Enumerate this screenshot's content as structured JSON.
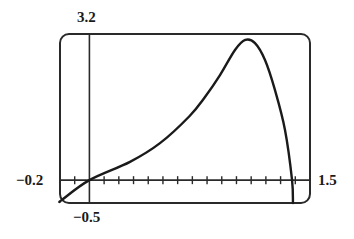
{
  "chart_data": {
    "type": "line",
    "title": "",
    "xlabel": "",
    "ylabel": "",
    "window": {
      "xmin": -0.2,
      "xmax": 1.5,
      "ymin": -0.5,
      "ymax": 3.2,
      "xscale": 0.1
    },
    "labels": {
      "xmin": "−0.2",
      "xmax": "1.5",
      "ymin": "−0.5",
      "ymax": "3.2"
    },
    "grid": false,
    "series": [
      {
        "name": "curve",
        "x": [
          -0.2,
          -0.186,
          0,
          0.276,
          0.48,
          0.68,
          0.786,
          0.888,
          0.99,
          1.06,
          1.126,
          1.194,
          1.262,
          1.33,
          1.378,
          1.384
        ],
        "y": [
          -0.47,
          -0.43,
          0,
          0.4,
          0.81,
          1.4,
          1.82,
          2.3,
          2.85,
          3.07,
          3.0,
          2.63,
          1.97,
          1.1,
          0,
          -0.5
        ]
      }
    ]
  },
  "style": {
    "line_color": "#1a1a1a",
    "frame_color": "#2a2a2a"
  }
}
